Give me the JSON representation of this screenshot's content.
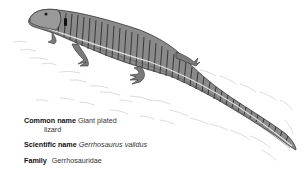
{
  "figure": {
    "subject_icon": "lizard-illustration",
    "colors": {
      "background": "#ffffff",
      "ink": "#333333",
      "sketch": "#bdbdbd"
    }
  },
  "caption": {
    "common_name": {
      "label": "Common name",
      "value_line1": "Giant plated",
      "value_line2": "lizard"
    },
    "scientific_name": {
      "label": "Scientific name",
      "value": "Gerrhosaurus validus"
    },
    "family": {
      "label": "Family",
      "value": "Gerrhosauridae"
    }
  }
}
